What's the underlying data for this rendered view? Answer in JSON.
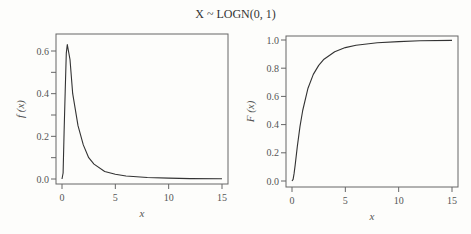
{
  "title": "X ~ LOGN(0, 1)",
  "chart_data": [
    {
      "type": "line",
      "title": "X ~ LOGN(0, 1)",
      "xlabel": "x",
      "ylabel": "f (x)",
      "xlim": [
        0,
        15
      ],
      "ylim": [
        0,
        0.66
      ],
      "xticks": [
        "0",
        "5",
        "10",
        "15"
      ],
      "yticks": [
        "0.0",
        "0.2",
        "0.4",
        "0.6"
      ],
      "grid": false,
      "series": [
        {
          "name": "pdf",
          "x": [
            0,
            0.1,
            0.2,
            0.3,
            0.4,
            0.5,
            0.75,
            1,
            1.5,
            2,
            2.5,
            3,
            4,
            5,
            6,
            8,
            10,
            12,
            15
          ],
          "values": [
            0,
            0.028,
            0.22,
            0.41,
            0.59,
            0.63,
            0.56,
            0.4,
            0.25,
            0.16,
            0.1,
            0.07,
            0.035,
            0.022,
            0.014,
            0.007,
            0.004,
            0.002,
            0.001
          ]
        }
      ]
    },
    {
      "type": "line",
      "title": "X ~ LOGN(0, 1)",
      "xlabel": "x",
      "ylabel": "F (x)",
      "xlim": [
        0,
        15
      ],
      "ylim": [
        0,
        1.0
      ],
      "xticks": [
        "0",
        "5",
        "10",
        "15"
      ],
      "yticks": [
        "0.0",
        "0.2",
        "0.4",
        "0.6",
        "0.8",
        "1.0"
      ],
      "grid": false,
      "series": [
        {
          "name": "cdf",
          "x": [
            0,
            0.1,
            0.2,
            0.3,
            0.5,
            0.75,
            1,
            1.5,
            2,
            2.5,
            3,
            4,
            5,
            6,
            8,
            10,
            12,
            15
          ],
          "values": [
            0,
            0.011,
            0.054,
            0.114,
            0.244,
            0.387,
            0.5,
            0.658,
            0.756,
            0.82,
            0.864,
            0.917,
            0.946,
            0.963,
            0.981,
            0.989,
            0.994,
            0.997
          ]
        }
      ]
    }
  ]
}
